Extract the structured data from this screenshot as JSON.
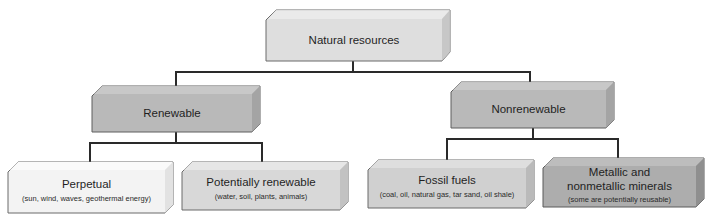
{
  "diagram": {
    "type": "hierarchy-tree",
    "root": {
      "id": "natural-resources",
      "title": "Natural resources",
      "fill": "#dcdcdc"
    },
    "level1": [
      {
        "id": "renewable",
        "title": "Renewable",
        "fill": "#b8b8b8"
      },
      {
        "id": "nonrenewable",
        "title": "Nonrenewable",
        "fill": "#b8b8b8"
      }
    ],
    "level2": [
      {
        "id": "perpetual",
        "parent": "renewable",
        "title": "Perpetual",
        "subtitle": "(sun, wind, waves, geothermal energy)",
        "fill": "#f0f0f0"
      },
      {
        "id": "potentially-renewable",
        "parent": "renewable",
        "title": "Potentially renewable",
        "subtitle": "(water, soil, plants, animals)",
        "fill": "#d6d6d6"
      },
      {
        "id": "fossil-fuels",
        "parent": "nonrenewable",
        "title": "Fossil fuels",
        "subtitle": "(coal, oil, natural gas, tar sand, oil shale)",
        "fill": "#cfcfcf"
      },
      {
        "id": "minerals",
        "parent": "nonrenewable",
        "title_line1": "Metallic and",
        "title_line2": "nonmetallic minerals",
        "subtitle": "(some are potentially reusable)",
        "fill": "#acacac"
      }
    ]
  }
}
